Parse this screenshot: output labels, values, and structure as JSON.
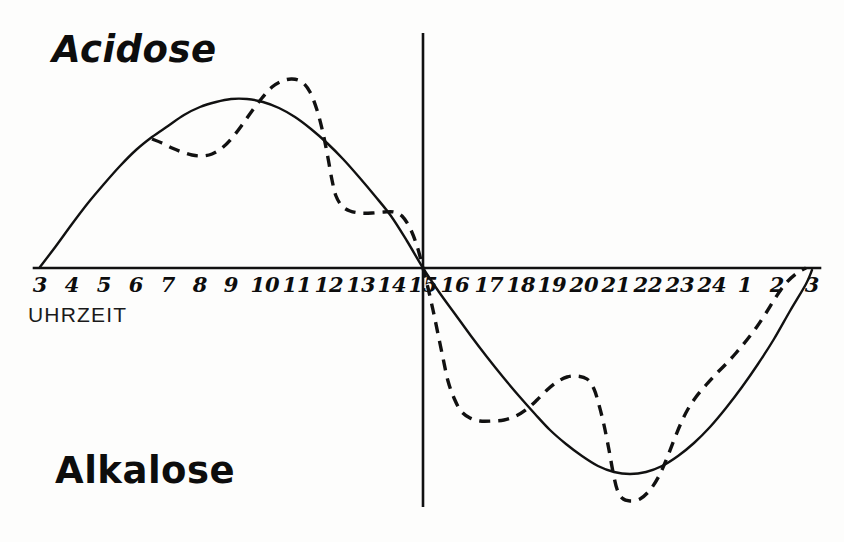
{
  "figure": {
    "background_color": "#fdfdfc",
    "ink_color": "#111111",
    "top_label": "Acidose",
    "bottom_label": "Alkalose",
    "axis_caption": "UHRZEIT"
  },
  "chart_data": {
    "type": "line",
    "title": "",
    "subtitle": "",
    "xlabel": "UHRZEIT",
    "ylabel": "",
    "annotations": [
      {
        "text": "Acidose",
        "position": "upper-left",
        "meaning": "positive / above-zero region"
      },
      {
        "text": "Alkalose",
        "position": "lower-left",
        "meaning": "negative / below-zero region"
      }
    ],
    "grid": false,
    "legend": "none",
    "x_axis": {
      "label": "UHRZEIT",
      "tick_labels": [
        "3",
        "4",
        "5",
        "6",
        "7",
        "8",
        "9",
        "10",
        "11",
        "12",
        "13",
        "14",
        "15",
        "16",
        "17",
        "18",
        "19",
        "20",
        "21",
        "22",
        "23",
        "24",
        "1",
        "2",
        "3"
      ],
      "tick_pixel_x": [
        40,
        72,
        104,
        136,
        168,
        200,
        231,
        263,
        295,
        327,
        359,
        391,
        423,
        455,
        487,
        519,
        550,
        582,
        614,
        646,
        678,
        710,
        742,
        774,
        812
      ],
      "zero_crossing_tick": "15",
      "note": "24-hour clock beginning at 03:00 and ending at 03:00 the following day"
    },
    "y_axis": {
      "baseline_pixel_y": 268,
      "ylim_note": "unlabelled arbitrary acid-base deviation scale; zero line = horizontal axis",
      "positive_direction": "Acidose",
      "negative_direction": "Alkalose"
    },
    "divider": {
      "kind": "vertical-line",
      "at_tick": "15",
      "pixel_x": 423,
      "pixel_y_top": 33,
      "pixel_y_bottom": 507
    },
    "series": [
      {
        "name": "solid-curve",
        "style": "solid",
        "stroke_width": 2.4,
        "color": "#111111",
        "description": "smooth sinusoidal circadian baseline: rises from 03:00, peaks near 09:00, crosses zero at 15:00, troughs near 21:00, returns to zero at 03:00",
        "points": [
          [
            40,
            267
          ],
          [
            56,
            246
          ],
          [
            72,
            224
          ],
          [
            88,
            203
          ],
          [
            104,
            184
          ],
          [
            120,
            166
          ],
          [
            136,
            150
          ],
          [
            152,
            137
          ],
          [
            168,
            126
          ],
          [
            184,
            115
          ],
          [
            200,
            107
          ],
          [
            216,
            102
          ],
          [
            231,
            99
          ],
          [
            247,
            99
          ],
          [
            263,
            102
          ],
          [
            279,
            108
          ],
          [
            295,
            117
          ],
          [
            311,
            129
          ],
          [
            327,
            143
          ],
          [
            343,
            159
          ],
          [
            359,
            177
          ],
          [
            375,
            196
          ],
          [
            391,
            216
          ],
          [
            407,
            241
          ],
          [
            423,
            268
          ],
          [
            439,
            292
          ],
          [
            455,
            314
          ],
          [
            471,
            336
          ],
          [
            487,
            357
          ],
          [
            503,
            377
          ],
          [
            519,
            396
          ],
          [
            535,
            414
          ],
          [
            550,
            430
          ],
          [
            566,
            444
          ],
          [
            582,
            456
          ],
          [
            598,
            466
          ],
          [
            614,
            472
          ],
          [
            630,
            474
          ],
          [
            646,
            472
          ],
          [
            662,
            466
          ],
          [
            678,
            456
          ],
          [
            694,
            443
          ],
          [
            710,
            427
          ],
          [
            726,
            408
          ],
          [
            742,
            387
          ],
          [
            758,
            364
          ],
          [
            774,
            339
          ],
          [
            790,
            311
          ],
          [
            806,
            284
          ],
          [
            812,
            270
          ]
        ]
      },
      {
        "name": "dashed-curve",
        "style": "dashed",
        "stroke_width": 3.4,
        "dash_pattern": "11 8",
        "color": "#111111",
        "description": "measured/observed curve with extra inflections: shoulder near 07:00, sharp peak near 10:30, plateau near 13:00-14:00, secondary minimum near 17:00, bump near 19:30-20:00, deep minimum near 21:00, recovery to 03:00",
        "points": [
          [
            152,
            139
          ],
          [
            162,
            143
          ],
          [
            172,
            148
          ],
          [
            182,
            152
          ],
          [
            192,
            155
          ],
          [
            202,
            156
          ],
          [
            212,
            154
          ],
          [
            222,
            148
          ],
          [
            232,
            138
          ],
          [
            242,
            125
          ],
          [
            252,
            111
          ],
          [
            262,
            98
          ],
          [
            272,
            87
          ],
          [
            282,
            81
          ],
          [
            292,
            79
          ],
          [
            302,
            82
          ],
          [
            310,
            92
          ],
          [
            317,
            110
          ],
          [
            323,
            133
          ],
          [
            328,
            158
          ],
          [
            332,
            180
          ],
          [
            336,
            196
          ],
          [
            342,
            206
          ],
          [
            350,
            211
          ],
          [
            360,
            213
          ],
          [
            372,
            213
          ],
          [
            384,
            212
          ],
          [
            394,
            212
          ],
          [
            402,
            216
          ],
          [
            410,
            228
          ],
          [
            417,
            246
          ],
          [
            423,
            268
          ],
          [
            428,
            288
          ],
          [
            433,
            310
          ],
          [
            438,
            334
          ],
          [
            443,
            358
          ],
          [
            448,
            381
          ],
          [
            454,
            398
          ],
          [
            461,
            411
          ],
          [
            470,
            418
          ],
          [
            480,
            421
          ],
          [
            492,
            421
          ],
          [
            504,
            420
          ],
          [
            516,
            416
          ],
          [
            527,
            409
          ],
          [
            537,
            400
          ],
          [
            547,
            390
          ],
          [
            557,
            382
          ],
          [
            567,
            377
          ],
          [
            577,
            376
          ],
          [
            587,
            379
          ],
          [
            594,
            389
          ],
          [
            599,
            405
          ],
          [
            604,
            425
          ],
          [
            609,
            450
          ],
          [
            613,
            472
          ],
          [
            617,
            489
          ],
          [
            622,
            498
          ],
          [
            630,
            501
          ],
          [
            640,
            499
          ],
          [
            650,
            490
          ],
          [
            659,
            476
          ],
          [
            667,
            458
          ],
          [
            674,
            440
          ],
          [
            681,
            423
          ],
          [
            688,
            409
          ],
          [
            696,
            397
          ],
          [
            706,
            385
          ],
          [
            716,
            374
          ],
          [
            726,
            364
          ],
          [
            736,
            353
          ],
          [
            746,
            341
          ],
          [
            756,
            328
          ],
          [
            766,
            313
          ],
          [
            776,
            297
          ],
          [
            786,
            283
          ],
          [
            797,
            273
          ],
          [
            806,
            268
          ]
        ]
      }
    ]
  },
  "tick_labels": [
    {
      "text": "3",
      "x": 40
    },
    {
      "text": "4",
      "x": 72
    },
    {
      "text": "5",
      "x": 104
    },
    {
      "text": "6",
      "x": 136
    },
    {
      "text": "7",
      "x": 168
    },
    {
      "text": "8",
      "x": 200
    },
    {
      "text": "9",
      "x": 231
    },
    {
      "text": "10",
      "x": 265
    },
    {
      "text": "11",
      "x": 297
    },
    {
      "text": "12",
      "x": 329
    },
    {
      "text": "13",
      "x": 361
    },
    {
      "text": "14",
      "x": 392
    },
    {
      "text": "15",
      "x": 423
    },
    {
      "text": "16",
      "x": 455
    },
    {
      "text": "17",
      "x": 489
    },
    {
      "text": "18",
      "x": 521
    },
    {
      "text": "19",
      "x": 552
    },
    {
      "text": "20",
      "x": 584
    },
    {
      "text": "21",
      "x": 616
    },
    {
      "text": "22",
      "x": 648
    },
    {
      "text": "23",
      "x": 680
    },
    {
      "text": "24",
      "x": 712
    },
    {
      "text": "1",
      "x": 745
    },
    {
      "text": "2",
      "x": 777
    },
    {
      "text": "3",
      "x": 812
    }
  ]
}
